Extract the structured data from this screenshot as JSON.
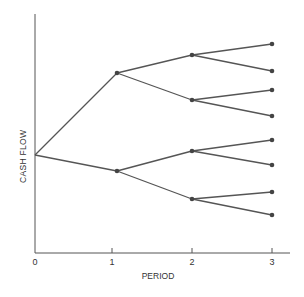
{
  "diagram": {
    "type": "binomial-tree",
    "x_axis": {
      "label": "PERIOD",
      "ticks": [
        "0",
        "1",
        "2",
        "3"
      ]
    },
    "y_axis": {
      "label": "CASH FLOW"
    },
    "colors": {
      "line": "#555555",
      "node": "#444444",
      "axis": "#555555"
    },
    "nodes": [
      {
        "id": "n0",
        "period": 0,
        "x": 35,
        "y": 155
      },
      {
        "id": "n1u",
        "period": 1,
        "x": 117,
        "y": 73
      },
      {
        "id": "n1d",
        "period": 1,
        "x": 117,
        "y": 171
      },
      {
        "id": "n2uu",
        "period": 2,
        "x": 192,
        "y": 55
      },
      {
        "id": "n2ud",
        "period": 2,
        "x": 192,
        "y": 100
      },
      {
        "id": "n2du",
        "period": 2,
        "x": 192,
        "y": 151
      },
      {
        "id": "n2dd",
        "period": 2,
        "x": 192,
        "y": 199
      },
      {
        "id": "n3a",
        "period": 3,
        "x": 272,
        "y": 44
      },
      {
        "id": "n3b",
        "period": 3,
        "x": 272,
        "y": 71
      },
      {
        "id": "n3c",
        "period": 3,
        "x": 272,
        "y": 90
      },
      {
        "id": "n3d",
        "period": 3,
        "x": 272,
        "y": 116
      },
      {
        "id": "n3e",
        "period": 3,
        "x": 272,
        "y": 140
      },
      {
        "id": "n3f",
        "period": 3,
        "x": 272,
        "y": 165
      },
      {
        "id": "n3g",
        "period": 3,
        "x": 272,
        "y": 192
      },
      {
        "id": "n3h",
        "period": 3,
        "x": 272,
        "y": 215
      }
    ],
    "edges": [
      [
        "n0",
        "n1u"
      ],
      [
        "n0",
        "n1d"
      ],
      [
        "n1u",
        "n2uu"
      ],
      [
        "n1u",
        "n2ud"
      ],
      [
        "n1d",
        "n2du"
      ],
      [
        "n1d",
        "n2dd"
      ],
      [
        "n2uu",
        "n3a"
      ],
      [
        "n2uu",
        "n3b"
      ],
      [
        "n2ud",
        "n3c"
      ],
      [
        "n2ud",
        "n3d"
      ],
      [
        "n2du",
        "n3e"
      ],
      [
        "n2du",
        "n3f"
      ],
      [
        "n2dd",
        "n3g"
      ],
      [
        "n2dd",
        "n3h"
      ]
    ]
  }
}
